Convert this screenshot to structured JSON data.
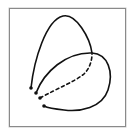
{
  "figure": {
    "stroke_color": "#111111",
    "frame_color": "#8a8a8a",
    "background": "#ffffff"
  }
}
